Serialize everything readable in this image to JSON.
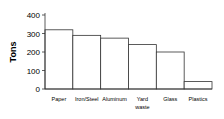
{
  "chart_data": {
    "type": "bar",
    "title": "",
    "xlabel": "",
    "ylabel": "Tons",
    "ylim": [
      0,
      400
    ],
    "yticks": [
      0,
      100,
      200,
      300,
      400
    ],
    "grid": false,
    "legend": null,
    "categories": [
      "Paper",
      "Iron/Steel",
      "Aluminum",
      "Yard waste",
      "Glass",
      "Plastics"
    ],
    "category_label_lines": [
      [
        "Paper"
      ],
      [
        "Iron/Steel"
      ],
      [
        "Aluminum"
      ],
      [
        "Yard",
        "waste"
      ],
      [
        "Glass"
      ],
      [
        "Plastics"
      ]
    ],
    "values": [
      320,
      290,
      275,
      240,
      200,
      40
    ],
    "colors": {
      "bar_fill": "#ffffff",
      "bar_stroke": "#333333",
      "axis": "#333333"
    }
  }
}
